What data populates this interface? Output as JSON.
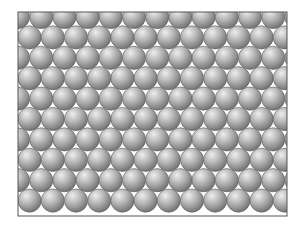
{
  "diagram": {
    "kind": "hexagonal close-packed sphere layer",
    "frame": {
      "x": 18,
      "y": 12,
      "width": 269,
      "height": 204,
      "stroke": "#555555"
    },
    "spheres": {
      "radius": 11.6,
      "pitch_x": 23.2,
      "pitch_y": 20.4,
      "rows": 10,
      "first_row_y": 17,
      "even_row_start_x": 18,
      "odd_row_start_x": 29.6,
      "per_row": 13,
      "highlight_color": "#eeeeee",
      "mid_color": "#b8b8b8",
      "shadow_color": "#6e6e6e",
      "outline_color": "#5a5a5a"
    },
    "background_color": "#ffffff"
  }
}
